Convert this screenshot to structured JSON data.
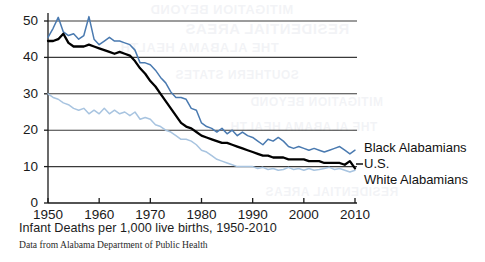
{
  "chart_data": {
    "type": "line",
    "title": "",
    "caption": "Infant Deaths per 1,000 live births, 1950-2010",
    "source": "Data from Alabama Department of Public Health",
    "xlabel": "",
    "ylabel": "",
    "xlim": [
      1950,
      2010
    ],
    "ylim": [
      0,
      50
    ],
    "grid": "horizontal",
    "legend_position": "right-inline",
    "xticks": [
      1950,
      1960,
      1970,
      1980,
      1990,
      2000,
      2010
    ],
    "xtick_labels": [
      "1950",
      "1960",
      "1970",
      "1980",
      "1990",
      "2000",
      "2010"
    ],
    "yticks": [
      0,
      10,
      20,
      30,
      40,
      50
    ],
    "ytick_labels": [
      "0",
      "10",
      "20",
      "30",
      "40",
      "50"
    ],
    "x": [
      1950,
      1951,
      1952,
      1953,
      1954,
      1955,
      1956,
      1957,
      1958,
      1959,
      1960,
      1961,
      1962,
      1963,
      1964,
      1965,
      1966,
      1967,
      1968,
      1969,
      1970,
      1971,
      1972,
      1973,
      1974,
      1975,
      1976,
      1977,
      1978,
      1979,
      1980,
      1981,
      1982,
      1983,
      1984,
      1985,
      1986,
      1987,
      1988,
      1989,
      1990,
      1991,
      1992,
      1993,
      1994,
      1995,
      1996,
      1997,
      1998,
      1999,
      2000,
      2001,
      2002,
      2003,
      2004,
      2005,
      2006,
      2007,
      2008,
      2009,
      2010
    ],
    "series": [
      {
        "name": "Black Alabamians",
        "color": "#4a7ab0",
        "values": [
          45.5,
          48.0,
          51.0,
          47.0,
          46.0,
          46.5,
          45.0,
          46.0,
          51.2,
          45.0,
          43.5,
          44.5,
          45.5,
          44.5,
          44.5,
          44.0,
          43.5,
          42.0,
          38.5,
          38.5,
          38.0,
          36.5,
          34.5,
          33.0,
          30.5,
          29.0,
          29.0,
          28.5,
          26.0,
          25.5,
          22.0,
          21.0,
          20.5,
          19.5,
          20.5,
          19.0,
          20.0,
          18.5,
          19.5,
          18.5,
          18.0,
          17.0,
          16.0,
          17.5,
          17.0,
          18.0,
          17.0,
          15.5,
          15.0,
          15.5,
          15.0,
          14.5,
          15.0,
          14.5,
          14.0,
          14.5,
          15.0,
          15.5,
          14.5,
          13.5,
          14.5
        ]
      },
      {
        "name": "U.S.",
        "color": "#000000",
        "values": [
          44.5,
          44.5,
          45.0,
          46.5,
          44.0,
          43.0,
          43.0,
          43.0,
          43.5,
          43.0,
          42.5,
          42.0,
          41.5,
          41.0,
          41.5,
          41.0,
          40.5,
          39.0,
          37.0,
          35.5,
          33.5,
          32.0,
          30.0,
          28.0,
          26.0,
          24.0,
          22.0,
          21.0,
          20.5,
          19.5,
          18.5,
          18.0,
          17.5,
          17.0,
          16.5,
          16.5,
          16.0,
          15.5,
          15.0,
          14.5,
          14.0,
          13.5,
          13.0,
          13.0,
          12.5,
          12.5,
          12.5,
          12.0,
          12.0,
          12.0,
          12.0,
          11.5,
          11.5,
          11.5,
          11.0,
          11.0,
          11.0,
          11.0,
          10.5,
          11.5,
          9.5
        ]
      },
      {
        "name": "White Alabamians",
        "color": "#a8c4e0",
        "values": [
          30.0,
          29.0,
          28.5,
          27.5,
          27.0,
          26.0,
          25.5,
          26.0,
          24.5,
          25.5,
          24.5,
          26.0,
          24.5,
          25.5,
          24.5,
          25.0,
          24.0,
          25.0,
          23.0,
          23.5,
          23.0,
          21.5,
          21.0,
          20.0,
          19.5,
          18.5,
          17.5,
          17.5,
          17.0,
          16.0,
          14.5,
          14.0,
          13.0,
          12.0,
          11.5,
          11.0,
          10.5,
          10.0,
          10.0,
          10.0,
          10.0,
          9.5,
          9.8,
          9.2,
          9.5,
          9.0,
          9.2,
          9.8,
          9.2,
          9.5,
          9.0,
          9.5,
          9.0,
          9.2,
          9.5,
          9.8,
          9.2,
          9.5,
          9.0,
          8.5,
          9.0
        ]
      }
    ]
  },
  "legend": {
    "items": [
      {
        "label": "Black Alabamians",
        "color": "#4a7ab0"
      },
      {
        "label": "U.S.",
        "color": "#000000"
      },
      {
        "label": "White Alabamians",
        "color": "#a8c4e0"
      }
    ]
  },
  "background_bleed": {
    "lines": [
      "MITIGATION BEYOND",
      "RESIDENTIAL AREAS",
      "THE ALABAMA HEALTH",
      "SOUTHERN STATES"
    ]
  },
  "colors": {
    "axis": "#1a1a1a",
    "grid": "#3a3a3a",
    "background": "#ffffff"
  }
}
